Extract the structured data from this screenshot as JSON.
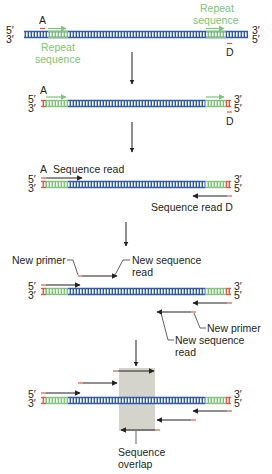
{
  "figure": {
    "colors": {
      "dna_unique": "#2e5aa8",
      "dna_repeat": "#7cc576",
      "primer": "#e8553e",
      "arrow": "#231f20",
      "overlap_box": "#d4d4cc",
      "label_green": "#7cc576",
      "text": "#231f20"
    },
    "ends": {
      "top_left": "5′",
      "bottom_left": "3′",
      "top_right": "3′",
      "bottom_right": "5′"
    }
  },
  "panels": [
    {
      "id": "panel-1",
      "description": "Target DNA with repeat sequences near each end and primer sites A and D",
      "dna_y": 34,
      "labels": {
        "primer_a": "A",
        "primer_d": "D",
        "repeat_left": "Repeat sequence",
        "repeat_left_line1": "Repeat",
        "repeat_left_line2": "sequence",
        "repeat_right_line1": "Repeat",
        "repeat_right_line2": "sequence"
      }
    },
    {
      "id": "panel-2",
      "description": "Primers A and D annealed at the ends",
      "dna_y": 103,
      "labels": {
        "primer_a": "A",
        "primer_d": "D"
      }
    },
    {
      "id": "panel-3",
      "description": "Initial sequence reads from primers A and D",
      "dna_y": 182,
      "labels": {
        "primer_a": "A",
        "read_a": "Sequence read",
        "read_d": "Sequence read D"
      }
    },
    {
      "id": "panel-4",
      "description": "New primers designed from ends of previous reads",
      "dna_y": 289,
      "labels": {
        "new_primer_left": "New primer",
        "new_read_left_line1": "New sequence",
        "new_read_left_line2": "read",
        "new_primer_right": "New primer",
        "new_read_right_line1": "New sequence",
        "new_read_right_line2": "read"
      }
    },
    {
      "id": "panel-5",
      "description": "Successive reads meet in the middle with overlapping sequence",
      "dna_y": 401,
      "labels": {
        "overlap_line1": "Sequence",
        "overlap_line2": "overlap"
      }
    }
  ],
  "step_arrows": [
    {
      "x": 132,
      "y1": 52,
      "y2": 84
    },
    {
      "x": 132,
      "y1": 122,
      "y2": 152
    },
    {
      "x": 126,
      "y1": 222,
      "y2": 246
    },
    {
      "x": 136,
      "y1": 340,
      "y2": 366
    }
  ]
}
